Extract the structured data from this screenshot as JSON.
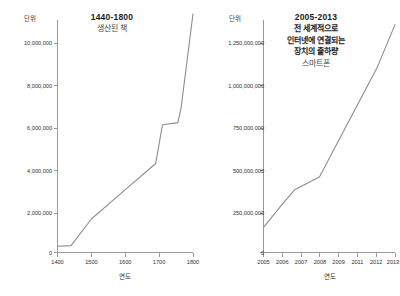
{
  "page": {
    "background": "#ffffff",
    "line_color": "#8d8d8d",
    "axis_color": "#9a9a9a"
  },
  "chart_data": [
    {
      "id": "books-produced",
      "type": "line",
      "title": "1440-1800",
      "subtitle": "생산된 책",
      "unit_label": "단위",
      "xlabel": "연도",
      "ylabel": "",
      "xlim": [
        1400,
        1800
      ],
      "ylim": [
        0,
        11500000
      ],
      "yticks": [
        0,
        2000000,
        4000000,
        6000000,
        8000000,
        10000000
      ],
      "ytick_labels": [
        "0",
        "2,000,000",
        "4,000,000",
        "6,000,000",
        "8,000,000",
        "10,000,000"
      ],
      "xticks": [
        1400,
        1500,
        1600,
        1700,
        1800
      ],
      "xtick_labels": [
        "1400",
        "1500",
        "1600",
        "1700",
        "1800"
      ],
      "grid": false,
      "legend": "none",
      "x": [
        1400,
        1440,
        1500,
        1600,
        1690,
        1710,
        1755,
        1765,
        1800
      ],
      "values": [
        300000,
        330000,
        1600000,
        3000000,
        4250000,
        6100000,
        6200000,
        6900000,
        11400000
      ]
    },
    {
      "id": "internet-connected-devices",
      "type": "line",
      "title": "2005-2013",
      "subtitle": "전 세계적으로\n인터넷에 연결되는\n장치의 출하량",
      "subtitle_lines": [
        "전 세계적으로",
        "인터넷에 연결되는",
        "장치의 출하량"
      ],
      "note": "스마트폰",
      "unit_label": "단위",
      "xlabel": "연도",
      "ylabel": "",
      "xlim": [
        2005,
        2013
      ],
      "ylim": [
        0,
        1400000000
      ],
      "yticks": [
        0,
        250000000,
        500000000,
        750000000,
        1000000000,
        1250000000
      ],
      "ytick_labels": [
        "0",
        "250,000,000",
        "500,000,000",
        "750,000,000",
        "1,000,000,000",
        "1,250,000,000"
      ],
      "xticks": [
        2005,
        2006,
        2007,
        2008,
        2009,
        2011,
        2012,
        2013
      ],
      "xtick_labels": [
        "2005",
        "2006",
        "2007",
        "2008",
        "2009",
        "2011",
        "2012",
        "2013"
      ],
      "grid": false,
      "legend": "none",
      "x": [
        2005,
        2006,
        2006.9,
        2008.4,
        2011.9,
        2013
      ],
      "values": [
        150000000,
        270000000,
        375000000,
        450000000,
        1100000000,
        1360000000
      ]
    }
  ]
}
